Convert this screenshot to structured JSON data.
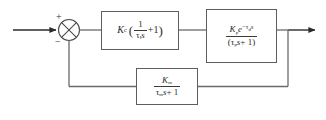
{
  "diagram": {
    "type": "control-system-block-diagram",
    "line_color": "#6a6a6a",
    "block_border_color": "#5e5e5e",
    "background": "#ffffff",
    "summing_junction": {
      "name": "summing-junction",
      "shape": "circle-with-x-cross",
      "inputs": [
        {
          "label": "+",
          "from": "setpoint",
          "direction": "left"
        },
        {
          "label": "−",
          "from": "measurement-feedback",
          "direction": "bottom"
        }
      ]
    },
    "signals": {
      "input_label": "",
      "output_label": ""
    },
    "blocks": [
      {
        "name": "controller-block",
        "role": "PI controller",
        "expression": "K_c ( 1/(tau_I s) + 1 )",
        "gain": "K",
        "gain_sub": "c",
        "paren_open": "(",
        "paren_close": ")",
        "frac_num": "1",
        "frac_den_tau": "τ",
        "frac_den_sub": "I",
        "frac_den_s": "s",
        "plus_one": "+1"
      },
      {
        "name": "process-block",
        "role": "first-order plus dead time process",
        "expression": "K_p e^(-tau_d s) / (tau_p s + 1)",
        "num_gain": "K",
        "num_gain_sub": "p",
        "num_exp_base": "e",
        "num_exp_minus": "−",
        "num_exp_tau": "τ",
        "num_exp_tau_sub": "d",
        "num_exp_s": "s",
        "den_open": "(",
        "den_tau": "τ",
        "den_tau_sub": "p",
        "den_s": "s",
        "den_plus": "+ 1",
        "den_close": ")"
      },
      {
        "name": "measurement-block",
        "role": "measurement / sensor transfer function",
        "expression": "K_m / (tau_m s + 1)",
        "num_gain": "K",
        "num_gain_sub": "m",
        "den_tau": "τ",
        "den_tau_sub": "m",
        "den_s": "s",
        "den_plus": "+ 1"
      }
    ]
  }
}
